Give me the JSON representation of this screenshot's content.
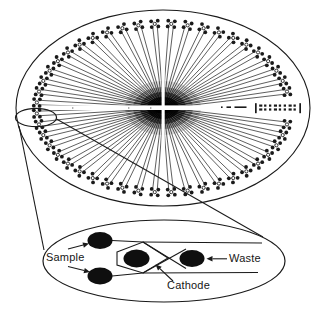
{
  "figure": {
    "kind": "scientific-line-diagram"
  },
  "colors": {
    "ink": "#1a1a1a",
    "well_fill": "#0f0f0f",
    "background": "#ffffff",
    "speck": "#8f8f8f"
  },
  "labels": {
    "sample": {
      "text": "Sample"
    },
    "waste": {
      "text": "Waste"
    },
    "cathode": {
      "text": "Cathode"
    }
  },
  "wafer": {
    "cx": 163,
    "cy": 108,
    "rx": 147,
    "ry": 98,
    "outline_w": 1.1,
    "clusters": {
      "count": 48,
      "angle_offset_deg": 3.75,
      "step_deg": 7.5,
      "skip": [
        0,
        47
      ],
      "radius_factor": 0.86,
      "dot_r": 1.9,
      "dot_spread_t": 3.3,
      "dot_spread_r": 2.9,
      "center_circle_r": 1.6
    },
    "channels": {
      "per_cluster": 2,
      "stroke_w": 0.7,
      "outer_pull": 4,
      "tangential_outer": 2.3,
      "inner_radius": 7,
      "tangential_inner": 0.6
    },
    "blob_layers": [
      [
        38,
        27,
        0.14
      ],
      [
        30,
        21,
        0.3
      ],
      [
        23,
        16,
        0.5
      ],
      [
        16,
        11,
        0.75
      ],
      [
        9,
        6,
        1
      ]
    ],
    "cross": {
      "h_rect": [
        18,
        105.4,
        288,
        4.6
      ],
      "v_rect": [
        161.6,
        14,
        3.1,
        189
      ]
    },
    "marking": {
      "x": 255,
      "y": 103.2,
      "w": 46,
      "h": 10,
      "glyph_cols": 8,
      "glyph_rows": 2
    },
    "dashes": [
      [
        221,
        106.4,
        1.6
      ],
      [
        226.5,
        106.4,
        4.5
      ],
      [
        234.5,
        106.4,
        12
      ]
    ],
    "specks": [
      [
        72,
        107.3
      ],
      [
        128,
        107.3
      ],
      [
        150,
        107.3
      ]
    ]
  },
  "callout": {
    "highlight": {
      "cx": 36,
      "cy": 117.5,
      "rx": 20.5,
      "ry": 9.2
    },
    "lines": [
      [
        [
          19,
          126
        ],
        [
          44,
          250
        ]
      ],
      [
        [
          56.5,
          119
        ],
        [
          263,
          237
        ]
      ]
    ]
  },
  "detail": {
    "ellipse": {
      "cx": 164,
      "cy": 261,
      "rx": 121,
      "ry": 41
    },
    "wells": [
      {
        "name": "sample-well-top",
        "cx": 100,
        "cy": 240.5,
        "rx": 12.5,
        "ry": 8.5
      },
      {
        "name": "sample-well-bottom",
        "cx": 100,
        "cy": 276,
        "rx": 12.5,
        "ry": 8.5
      },
      {
        "name": "cathode-well",
        "cx": 136.5,
        "cy": 258.5,
        "rx": 13,
        "ry": 9
      },
      {
        "name": "waste-well",
        "cx": 192,
        "cy": 258.5,
        "rx": 12.5,
        "ry": 8.5
      }
    ],
    "injector_outline": [
      [
        117,
        252
      ],
      [
        143,
        242
      ],
      [
        168,
        258
      ],
      [
        143,
        273
      ],
      [
        117,
        265
      ]
    ],
    "channels": [
      [
        [
          112,
          240.5
        ],
        [
          143,
          242
        ]
      ],
      [
        [
          112,
          276
        ],
        [
          143,
          273
        ]
      ],
      [
        [
          143,
          242
        ],
        [
          262,
          243
        ]
      ],
      [
        [
          143,
          273
        ],
        [
          258,
          272.5
        ]
      ],
      [
        [
          143,
          242
        ],
        [
          186,
          268.5
        ]
      ],
      [
        [
          143,
          273
        ],
        [
          186,
          249
        ]
      ]
    ],
    "arrows": [
      {
        "name": "sample-arrow-top",
        "from": [
          68,
          249
        ],
        "to": [
          89,
          243.5
        ]
      },
      {
        "name": "sample-arrow-bottom",
        "from": [
          68,
          266.5
        ],
        "to": [
          90,
          272
        ]
      },
      {
        "name": "waste-arrow",
        "from": [
          227,
          258.8
        ],
        "to": [
          206.5,
          258.8
        ]
      },
      {
        "name": "cathode-arrow",
        "from": [
          173,
          281
        ],
        "to": [
          155.5,
          264.5
        ]
      }
    ]
  }
}
